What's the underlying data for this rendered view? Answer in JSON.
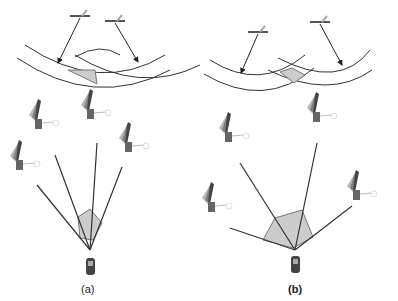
{
  "panels": [
    {
      "id": "a",
      "label": "(a)",
      "description": "Wide overlap region from satellites close together; narrow geometry"
    },
    {
      "id": "b",
      "label": "(b)",
      "description": "Small overlap region from satellites spread apart; wide geometry"
    }
  ],
  "colors": {
    "line": "#333333",
    "region_fill": "#cccccc",
    "region_stroke": "#777777",
    "sat_panel": "#555555",
    "receiver": "#444444"
  }
}
